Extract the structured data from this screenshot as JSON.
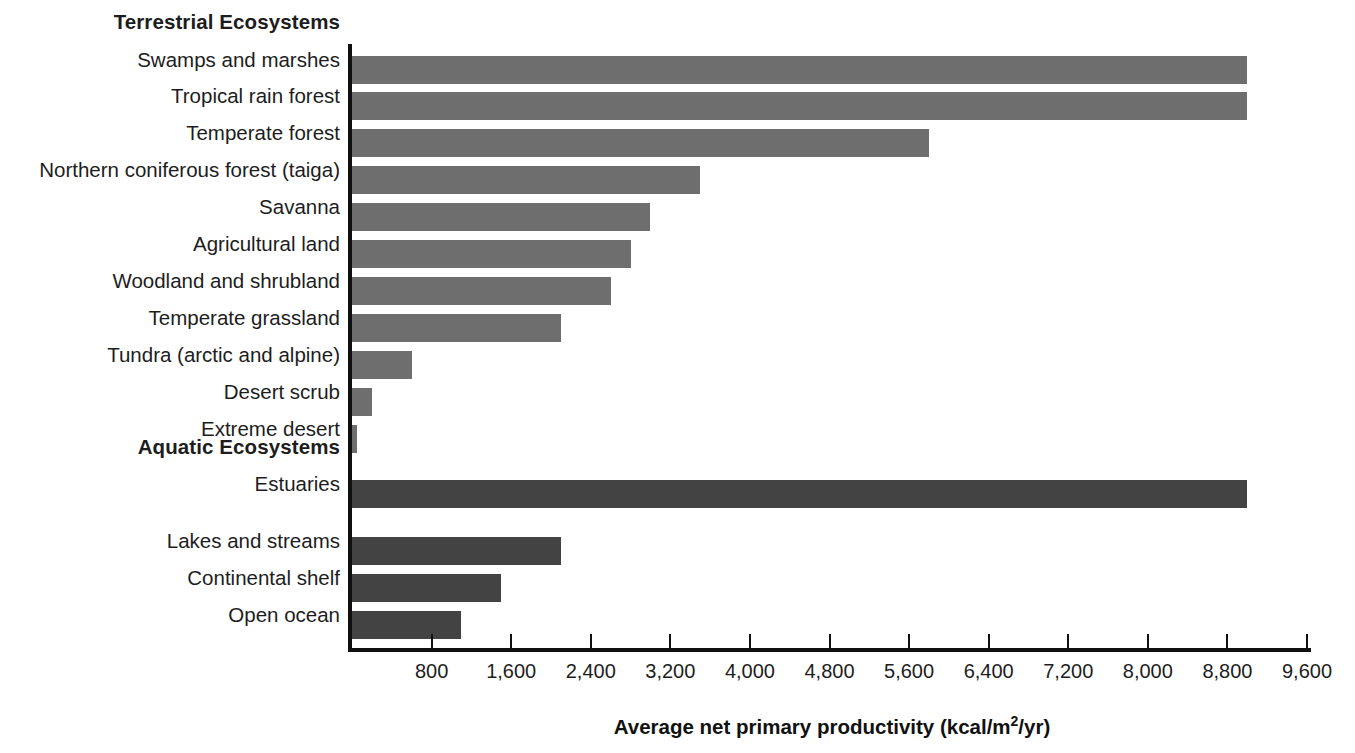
{
  "chart_data": {
    "type": "bar",
    "orientation": "horizontal",
    "title": "",
    "xlabel": "Average net primary productivity (kcal/m2/yr)",
    "xlabel_parts": {
      "pre": "Average net primary productivity (kcal/m",
      "sup": "2",
      "post": "/yr)"
    },
    "ylabel": "",
    "xlim": [
      0,
      9600
    ],
    "xticks": [
      800,
      1600,
      2400,
      3200,
      4000,
      4800,
      5600,
      6400,
      7200,
      8000,
      8800,
      9600
    ],
    "xticklabels": [
      "800",
      "1,600",
      "2,400",
      "3,200",
      "4,000",
      "4,800",
      "5,600",
      "6,400",
      "7,200",
      "8,000",
      "8,800",
      "9,600"
    ],
    "grid": false,
    "legend": "none",
    "groups": [
      {
        "name": "Terrestrial Ecosystems",
        "color": "#6e6e6e",
        "categories": [
          "Swamps and marshes",
          "Tropical rain forest",
          "Temperate forest",
          "Northern coniferous forest (taiga)",
          "Savanna",
          "Agricultural land",
          "Woodland and shrubland",
          "Temperate grassland",
          "Tundra (arctic and alpine)",
          "Desert scrub",
          "Extreme desert"
        ],
        "values": [
          9000,
          9000,
          5800,
          3500,
          3000,
          2800,
          2600,
          2100,
          600,
          200,
          50
        ]
      },
      {
        "name": "Aquatic Ecosystems",
        "color": "#434343",
        "categories": [
          "Estuaries",
          "Lakes and streams",
          "Continental shelf",
          "Open ocean"
        ],
        "values": [
          9000,
          2100,
          1500,
          1100
        ]
      }
    ]
  },
  "rows": [
    {
      "kind": "header",
      "label": "Terrestrial Ecosystems",
      "top": 12
    },
    {
      "kind": "bar",
      "label": "Swamps and marshes",
      "value": 9000,
      "series": "terrestrial",
      "top": 50,
      "height": 28
    },
    {
      "kind": "bar",
      "label": "Tropical rain forest",
      "value": 9000,
      "series": "terrestrial",
      "top": 86,
      "height": 28
    },
    {
      "kind": "bar",
      "label": "Temperate forest",
      "value": 5800,
      "series": "terrestrial",
      "top": 123,
      "height": 28
    },
    {
      "kind": "bar",
      "label": "Northern coniferous forest (taiga)",
      "value": 3500,
      "series": "terrestrial",
      "top": 160,
      "height": 28
    },
    {
      "kind": "bar",
      "label": "Savanna",
      "value": 3000,
      "series": "terrestrial",
      "top": 197,
      "height": 28
    },
    {
      "kind": "bar",
      "label": "Agricultural land",
      "value": 2800,
      "series": "terrestrial",
      "top": 234,
      "height": 28
    },
    {
      "kind": "bar",
      "label": "Woodland and shrubland",
      "value": 2600,
      "series": "terrestrial",
      "top": 271,
      "height": 28
    },
    {
      "kind": "bar",
      "label": "Temperate grassland",
      "value": 2100,
      "series": "terrestrial",
      "top": 308,
      "height": 28
    },
    {
      "kind": "bar",
      "label": "Tundra (arctic and alpine)",
      "value": 600,
      "series": "terrestrial",
      "top": 345,
      "height": 28
    },
    {
      "kind": "bar",
      "label": "Desert scrub",
      "value": 200,
      "series": "terrestrial",
      "top": 382,
      "height": 28
    },
    {
      "kind": "bar",
      "label": "Extreme desert",
      "value": 50,
      "series": "terrestrial",
      "top": 419,
      "height": 28
    },
    {
      "kind": "header",
      "label": "Aquatic Ecosystems",
      "top": 437
    },
    {
      "kind": "bar",
      "label": "Estuaries",
      "value": 9000,
      "series": "aquatic",
      "top": 474,
      "height": 28
    },
    {
      "kind": "bar",
      "label": "Lakes and streams",
      "value": 2100,
      "series": "aquatic",
      "top": 531,
      "height": 28
    },
    {
      "kind": "bar",
      "label": "Continental shelf",
      "value": 1500,
      "series": "aquatic",
      "top": 568,
      "height": 28
    },
    {
      "kind": "bar",
      "label": "Open ocean",
      "value": 1100,
      "series": "aquatic",
      "top": 605,
      "height": 28
    }
  ],
  "axis": {
    "title_pre": "Average net primary productivity (kcal/m",
    "title_sup": "2",
    "title_post": "/yr)"
  },
  "colors": {
    "terrestrial_bar": "#6e6e6e",
    "aquatic_bar": "#434343",
    "axis_line": "#101010",
    "text": "#1d1d1d",
    "background": "#ffffff"
  }
}
